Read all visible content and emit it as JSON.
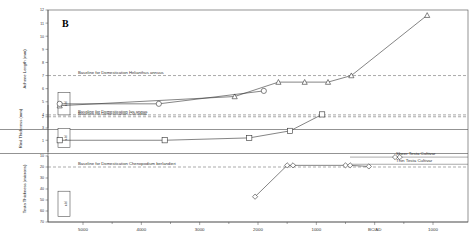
{
  "figure": {
    "panel_letter": "B",
    "width": 473,
    "height": 249
  },
  "chart_data": {
    "type": "line",
    "title": "",
    "subtitle": "",
    "xlabel": "",
    "grid": false,
    "legend_position": "inline-right",
    "x_axis": {
      "label": "",
      "tick_labels": [
        "5000",
        "4000",
        "3000",
        "2000",
        "1000",
        "BC/AD",
        "1000"
      ],
      "tick_values": [
        5000,
        4000,
        3000,
        2000,
        1000,
        0,
        -1000
      ],
      "direction": "decreasing-left-to-right",
      "xlim": [
        5600,
        -1600
      ]
    },
    "panels": [
      {
        "name": "achene-length-panel",
        "ylabel": "Achene Length (mm)",
        "ylim": [
          3,
          12
        ],
        "ytick_labels": [
          "3",
          "4",
          "5",
          "6",
          "7",
          "8",
          "9",
          "10",
          "11",
          "12"
        ],
        "ytick_values": [
          3,
          4,
          5,
          6,
          7,
          8,
          9,
          10,
          11,
          12
        ],
        "reference_lines": [
          {
            "label": "Baseline for Domestication Helianthus annuus",
            "value": 7.0,
            "style": "dashed"
          },
          {
            "label": "Baseline for Domestication Iva annua",
            "value": 4.0,
            "style": "dashed"
          }
        ],
        "wild_range_box": {
          "label": "wild",
          "low": 4.0,
          "high": 5.7
        },
        "series": [
          {
            "name": "Achene length (Helianthus / Iva)",
            "marker": "triangle",
            "points": [
              {
                "x": 5400,
                "y": 4.7
              },
              {
                "x": 2400,
                "y": 5.4
              },
              {
                "x": 1650,
                "y": 6.5
              },
              {
                "x": 1200,
                "y": 6.5
              },
              {
                "x": 800,
                "y": 6.5
              },
              {
                "x": 400,
                "y": 7.0
              },
              {
                "x": -900,
                "y": 11.6
              }
            ]
          }
        ]
      },
      {
        "name": "rind-thickness-panel",
        "ylabel": "Rind Thickness (mm)",
        "ylim": [
          0.5,
          2.5
        ],
        "ytick_labels": [
          "1",
          "2"
        ],
        "ytick_values": [
          1,
          2
        ],
        "reference_lines": [
          {
            "label": "Baseline for Domestication Cucurbita",
            "value": 2.0,
            "style": "dashed"
          }
        ],
        "wild_range_box": {
          "label": "wild",
          "low": 0.7,
          "high": 1.5
        },
        "series": [
          {
            "name": "Rind thickness (Cucurbita)",
            "marker": "square",
            "points": [
              {
                "x": 5400,
                "y": 1.0
              },
              {
                "x": 3600,
                "y": 1.0
              },
              {
                "x": 2150,
                "y": 1.1
              },
              {
                "x": 1450,
                "y": 1.4
              },
              {
                "x": 900,
                "y": 2.1
              }
            ]
          },
          {
            "name": "Cucurbita upper trace",
            "marker": "circle",
            "points": [
              {
                "x": 5400,
                "y": 2.55
              },
              {
                "x": 3700,
                "y": 2.55
              },
              {
                "x": 1900,
                "y": 3.1
              }
            ]
          }
        ]
      },
      {
        "name": "testa-thickness-panel",
        "ylabel": "Testa Thickness (microns)",
        "ylim": [
          10,
          70
        ],
        "inverted": true,
        "ytick_labels": [
          "10",
          "20",
          "30",
          "40",
          "50",
          "60",
          "70"
        ],
        "ytick_values": [
          10,
          20,
          30,
          40,
          50,
          60,
          70
        ],
        "reference_lines": [
          {
            "label": "Baseline for Domestication Chenopodium berlandieri",
            "value": 20.0,
            "style": "dashed"
          },
          {
            "label": "Sheer Testa Cultivar",
            "value": 11.0,
            "style": "solid"
          },
          {
            "label": "Thin Testa Cultivar",
            "value": 17.5,
            "style": "solid"
          }
        ],
        "wild_range_box": {
          "label": "wild",
          "low": 42.0,
          "high": 65.0
        },
        "series": [
          {
            "name": "Testa thickness (Chenopodium)",
            "marker": "diamond",
            "points": [
              {
                "x": 2050,
                "y": 47.0
              },
              {
                "x": 1500,
                "y": 18.5
              },
              {
                "x": 1400,
                "y": 18.5
              },
              {
                "x": 500,
                "y": 18.5
              },
              {
                "x": 420,
                "y": 18.5
              },
              {
                "x": 100,
                "y": 19.5
              }
            ]
          },
          {
            "name": "Sheer testa cultivar points",
            "marker": "diamond",
            "points": [
              {
                "x": -350,
                "y": 11.0
              },
              {
                "x": -430,
                "y": 11.0
              }
            ]
          }
        ]
      }
    ]
  }
}
